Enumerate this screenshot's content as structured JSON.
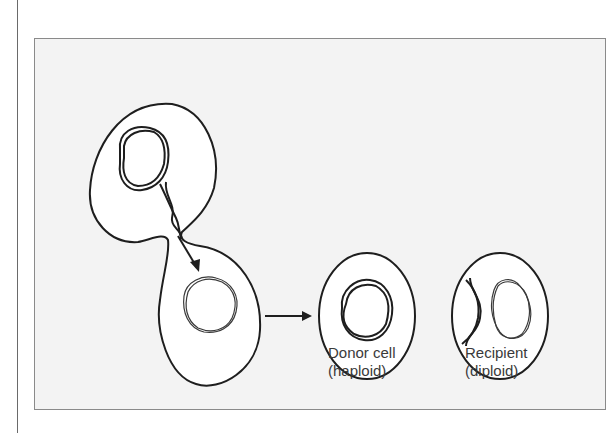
{
  "figure": {
    "cells": [
      {
        "name": "budding-cell",
        "role": "conjugation"
      },
      {
        "name": "donor-cell",
        "label_line1": "Donor cell",
        "label_line2": "(haploid)"
      },
      {
        "name": "recipient-cell",
        "label_line1": "Recipient",
        "label_line2": "(diploid)"
      }
    ],
    "colors": {
      "outline": "#1e1e1e",
      "frame_bg": "#f3f3f3",
      "cell_fill": "#ffffff",
      "text": "#3a3a3a"
    }
  }
}
